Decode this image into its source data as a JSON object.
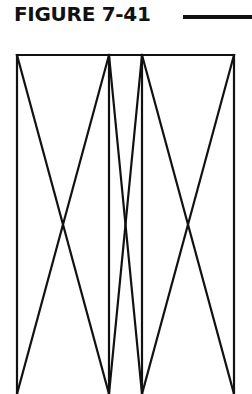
{
  "figure": {
    "title": "FIGURE 7-41",
    "stroke_color": "#111111",
    "background": "#ffffff"
  },
  "diagram": {
    "panels": [
      {
        "name": "left",
        "x1": 17,
        "x2": 109,
        "cross": [
          63,
          228
        ]
      },
      {
        "name": "middle",
        "x1": 109,
        "x2": 142,
        "cross": [
          125,
          228
        ]
      },
      {
        "name": "right",
        "x1": 142,
        "x2": 234,
        "cross": [
          188,
          228
        ]
      }
    ],
    "top_y": 55,
    "bottom_y": 394
  }
}
